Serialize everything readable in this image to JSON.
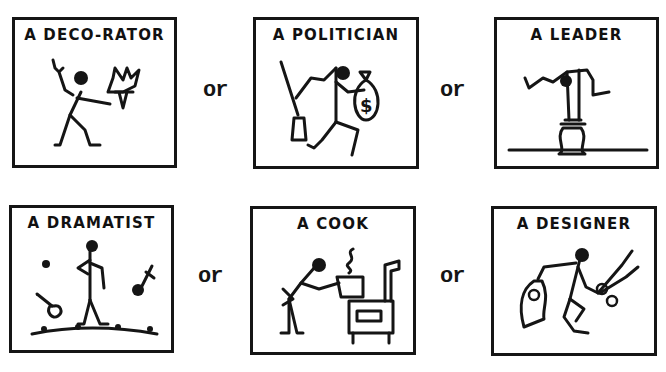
{
  "panels": [
    {
      "title": "A DECO-RATOR",
      "figure": "stick figure holding a crown-shaped lamp/ornament"
    },
    {
      "title": "A POLITICIAN",
      "figure": "stick figure with broom in one hand and money bag with dollar sign in the other"
    },
    {
      "title": "A LEADER",
      "figure": "stick figure stretched above a round pedestal on a line"
    },
    {
      "title": "A DRAMATIST",
      "figure": "stick figure on stage with thrown flowers"
    },
    {
      "title": "A COOK",
      "figure": "stick figure holding a steaming pot beside a wood stove"
    },
    {
      "title": "A DESIGNER",
      "figure": "stick figure holding scissors and a cut-out pattern"
    }
  ],
  "connectors": {
    "row1": [
      "or",
      "or"
    ],
    "row2": [
      "or",
      "or"
    ]
  },
  "symbols": {
    "money_bag": "$"
  },
  "colors": {
    "ink": "#151515",
    "paper": "#ffffff"
  }
}
